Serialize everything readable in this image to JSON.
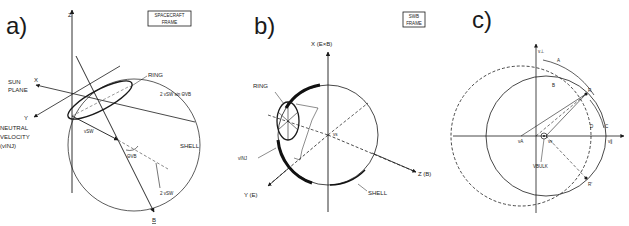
{
  "figure": {
    "panels": [
      {
        "id": "a",
        "label": "a)",
        "frame_label_line1": "SPACECRAFT",
        "frame_label_line2": "FRAME",
        "axes": {
          "z": "Z",
          "x": "X",
          "y": "Y",
          "b": "B"
        },
        "labels": {
          "sun_plane_line1": "SUN",
          "sun_plane_line2": "PLANE",
          "ring": "RING",
          "ring_radius": "2 vSW sin ΘVB",
          "neutral_line1": "NEUTRAL",
          "neutral_line2": "VELOCITY",
          "neutral_line3": "(vINJ)",
          "vsw": "vSW",
          "theta": "ΘVB",
          "shell": "SHELL",
          "two_vsw": "2 vSW"
        }
      },
      {
        "id": "b",
        "label": "b)",
        "frame_label_line1": "SWB",
        "frame_label_line2": "FRAME",
        "axes": {
          "x": "X (E×B)",
          "y": "Y (E)",
          "z": "Z (B)"
        },
        "labels": {
          "ring": "RING",
          "vinj": "vINJ",
          "vs": "vs",
          "shell": "SHELL"
        }
      },
      {
        "id": "c",
        "label": "c)",
        "axes": {
          "vperp": "v⊥",
          "vpar": "v∥"
        },
        "labels": {
          "A": "A",
          "B": "B",
          "C": "C",
          "D": "D",
          "R": "R",
          "R_prime": "R'",
          "vA": "vA",
          "vs": "vs",
          "vbulk": "VBULK"
        }
      }
    ]
  }
}
